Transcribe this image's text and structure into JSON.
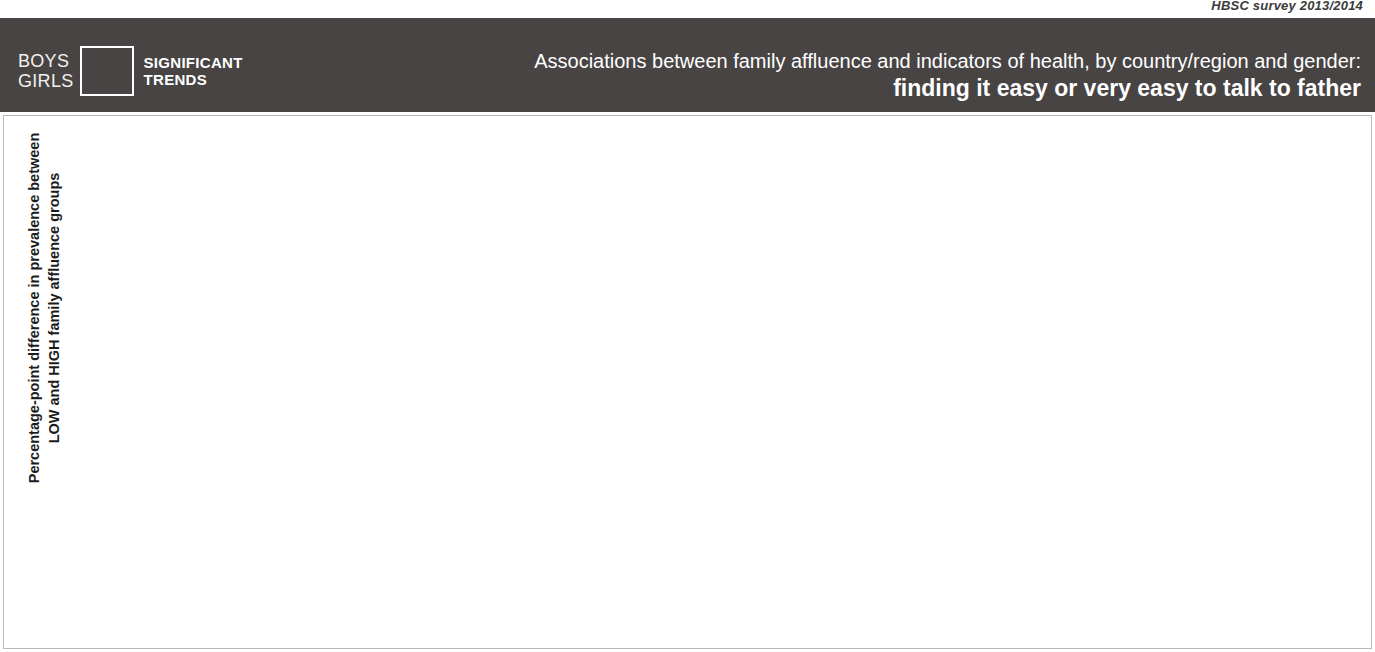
{
  "survey": {
    "label": "HBSC survey 2013/2014"
  },
  "header": {
    "legend": {
      "boys_label": "BOYS",
      "girls_label": "GIRLS",
      "trend_line1": "SIGNIFICANT",
      "trend_line2": "TRENDS",
      "colors": {
        "boys_nonsig": "#9d9d9d",
        "boys_sig": "#59a9e0",
        "girls_nonsig": "#4d4d4d",
        "girls_sig": "#f1665c"
      }
    },
    "title_line1": "Associations between family affluence and indicators of health, by country/region and gender:",
    "title_line2": "finding it easy or very easy to talk to father"
  },
  "axis": {
    "y_title": "Percentage-point difference in prevalence between LOW and HIGH family affluence groups",
    "ticks": [
      25,
      20,
      15,
      10,
      5,
      0,
      "−5",
      "−10",
      "−15",
      "−20",
      "−25"
    ]
  },
  "annotations": {
    "top_strong": "Prevalence increases",
    "top_rest": "with higher family affluence",
    "bottom_strong": "Prevalence decreases",
    "bottom_rest": "with higher family affluence"
  },
  "chart_data": {
    "type": "bar",
    "title": "Associations between family affluence and indicators of health, by country/region and gender: finding it easy or very easy to talk to father",
    "xlabel": "",
    "ylabel": "Percentage-point difference in prevalence between LOW and HIGH family affluence groups",
    "ylim": [
      -25,
      25
    ],
    "ytick_step": 5,
    "grid": true,
    "legend": [
      "Boys",
      "Girls"
    ],
    "legend_position": "header-left",
    "significance_colors": {
      "boys_significant": "#59a9e0",
      "boys_not_significant": "#9d9d9d",
      "girls_significant": "#f1665c",
      "girls_not_significant": "#4d4d4d"
    },
    "categories": [
      "Scotland",
      "Portugal",
      "Denmark",
      "Latvia",
      "Israel",
      "Slovakia",
      "Canada",
      "Hungary",
      "Croatia",
      "Sweden",
      "Poland",
      "Estonia",
      "Greenland",
      "MKDᵃ",
      "Germany",
      "Netherlands",
      "England",
      "Bulgaria",
      "Belgium (Flemish)",
      "Armenia",
      "Iceland",
      "Switzerland",
      "Spain",
      "Greece",
      "Belgium (French)",
      "Lithuania",
      "Wales",
      "Czech Republic",
      "Ukraine",
      "Albania",
      "France",
      "Russian Federation",
      "Slovenia",
      "Romania",
      "Ireland",
      "Finland",
      "Luxembourg",
      "Austria",
      "Norway",
      "Republic of Moldova",
      "Malta",
      "Italy"
    ],
    "series": [
      {
        "name": "Boys",
        "values": [
          12.6,
          7.0,
          7.0,
          8.0,
          8.9,
          10.8,
          14.7,
          10.7,
          4.1,
          10.8,
          5.2,
          8.9,
          11.8,
          10.5,
          8.9,
          8.0,
          6.0,
          10.2,
          13.6,
          7.0,
          6.0,
          8.9,
          7.0,
          7.0,
          7.0,
          1.8,
          8.0,
          7.0,
          4.0,
          6.0,
          8.9,
          5.1,
          1.8,
          0.8,
          0.8,
          2.9,
          2.9,
          2.9,
          1.9,
          1.9,
          0.6,
          -4.0
        ],
        "significant": [
          true,
          true,
          false,
          true,
          true,
          true,
          true,
          true,
          true,
          true,
          false,
          true,
          false,
          true,
          true,
          true,
          true,
          true,
          true,
          false,
          true,
          true,
          true,
          true,
          true,
          false,
          true,
          true,
          true,
          true,
          true,
          true,
          false,
          false,
          false,
          false,
          false,
          false,
          false,
          false,
          false,
          false
        ]
      },
      {
        "name": "Girls",
        "values": [
          18.8,
          17.8,
          17.8,
          15.6,
          14.8,
          11.8,
          8.9,
          12.6,
          17.7,
          11.7,
          16.7,
          12.6,
          9.9,
          10.0,
          12.6,
          12.6,
          13.6,
          11.0,
          7.0,
          12.6,
          12.6,
          8.9,
          10.7,
          9.9,
          10.7,
          14.8,
          7.0,
          8.9,
          10.7,
          8.9,
          6.0,
          9.9,
          10.6,
          11.7,
          9.9,
          6.9,
          6.0,
          6.0,
          5.0,
          3.8,
          4.0,
          1.0
        ],
        "significant": [
          true,
          true,
          true,
          true,
          true,
          true,
          true,
          true,
          true,
          true,
          true,
          true,
          false,
          true,
          true,
          true,
          true,
          true,
          false,
          true,
          true,
          true,
          true,
          true,
          true,
          true,
          false,
          true,
          true,
          true,
          false,
          true,
          true,
          true,
          true,
          true,
          false,
          false,
          false,
          false,
          false,
          false
        ]
      }
    ]
  }
}
